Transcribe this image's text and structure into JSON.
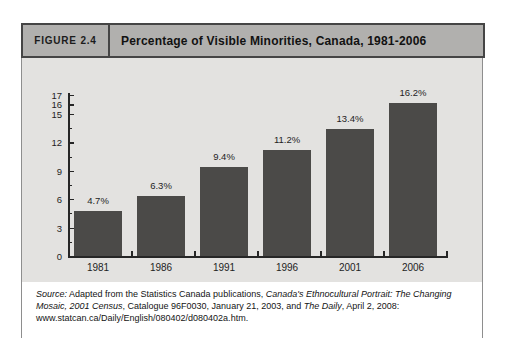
{
  "figure": {
    "label": "FIGURE 2.4",
    "title": "Percentage of Visible Minorities, Canada, 1981-2006"
  },
  "chart_data": {
    "type": "bar",
    "title": "Percentage of Visible Minorities, Canada, 1981-2006",
    "categories": [
      "1981",
      "1986",
      "1991",
      "1996",
      "2001",
      "2006"
    ],
    "values": [
      4.7,
      6.3,
      9.4,
      11.2,
      13.4,
      16.2
    ],
    "value_labels": [
      "4.7%",
      "6.3%",
      "9.4%",
      "11.2%",
      "13.4%",
      "16.2%"
    ],
    "xlabel": "",
    "ylabel": "",
    "ylim": [
      0,
      17
    ],
    "y_major_ticks": [
      0,
      3,
      6,
      9,
      12,
      15,
      16,
      17
    ],
    "y_minor_ticks": [
      1.5,
      4.5,
      7.5,
      10.5,
      13.5
    ],
    "grid": "off",
    "legend": "none"
  },
  "source": {
    "segments": [
      {
        "text": "Source:",
        "italic": true
      },
      {
        "text": " Adapted from the Statistics Canada publications, ",
        "italic": false
      },
      {
        "text": "Canada's Ethnocultural Portrait: The Changing Mosaic, 2001 Census",
        "italic": true
      },
      {
        "text": ", Catalogue 96F0030, January 21, 2003, and ",
        "italic": false
      },
      {
        "text": "The Daily",
        "italic": true
      },
      {
        "text": ", April 2, 2008: www.statcan.ca/Daily/English/080402/d080402a.htm.",
        "italic": false
      }
    ]
  },
  "colors": {
    "header_bg": "#b1b0ae",
    "header_border": "#454545",
    "panel_bg": "#e3e2e0",
    "bar": "#4b4a48",
    "axis": "#262626",
    "text": "#1e1e1e",
    "outer_border": "#8e8e8e"
  }
}
